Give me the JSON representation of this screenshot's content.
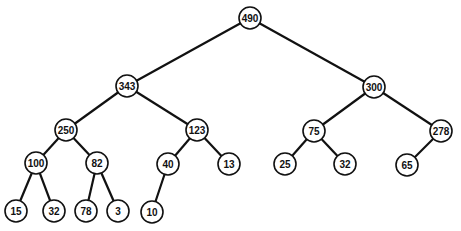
{
  "diagram": {
    "type": "binary-tree",
    "nodes": [
      {
        "id": "n490",
        "label": "490",
        "x": 250,
        "y": 18
      },
      {
        "id": "n343",
        "label": "343",
        "x": 127,
        "y": 86
      },
      {
        "id": "n300",
        "label": "300",
        "x": 374,
        "y": 87
      },
      {
        "id": "n250",
        "label": "250",
        "x": 66,
        "y": 130
      },
      {
        "id": "n123",
        "label": "123",
        "x": 197,
        "y": 130
      },
      {
        "id": "n75",
        "label": "75",
        "x": 314,
        "y": 131
      },
      {
        "id": "n278",
        "label": "278",
        "x": 441,
        "y": 131
      },
      {
        "id": "n100",
        "label": "100",
        "x": 36,
        "y": 163
      },
      {
        "id": "n82",
        "label": "82",
        "x": 97,
        "y": 163
      },
      {
        "id": "n40",
        "label": "40",
        "x": 168,
        "y": 164
      },
      {
        "id": "n13",
        "label": "13",
        "x": 229,
        "y": 164
      },
      {
        "id": "n25",
        "label": "25",
        "x": 285,
        "y": 164
      },
      {
        "id": "n32b",
        "label": "32",
        "x": 345,
        "y": 164
      },
      {
        "id": "n65",
        "label": "65",
        "x": 407,
        "y": 165
      },
      {
        "id": "n15",
        "label": "15",
        "x": 16,
        "y": 211
      },
      {
        "id": "n32a",
        "label": "32",
        "x": 54,
        "y": 211
      },
      {
        "id": "n78",
        "label": "78",
        "x": 86,
        "y": 211
      },
      {
        "id": "n3",
        "label": "3",
        "x": 118,
        "y": 211
      },
      {
        "id": "n10",
        "label": "10",
        "x": 152,
        "y": 212
      }
    ],
    "edges": [
      [
        "n490",
        "n343"
      ],
      [
        "n490",
        "n300"
      ],
      [
        "n343",
        "n250"
      ],
      [
        "n343",
        "n123"
      ],
      [
        "n300",
        "n75"
      ],
      [
        "n300",
        "n278"
      ],
      [
        "n250",
        "n100"
      ],
      [
        "n250",
        "n82"
      ],
      [
        "n123",
        "n40"
      ],
      [
        "n123",
        "n13"
      ],
      [
        "n75",
        "n25"
      ],
      [
        "n75",
        "n32b"
      ],
      [
        "n278",
        "n65"
      ],
      [
        "n100",
        "n15"
      ],
      [
        "n100",
        "n32a"
      ],
      [
        "n82",
        "n78"
      ],
      [
        "n82",
        "n3"
      ],
      [
        "n40",
        "n10"
      ]
    ],
    "node_radius": 11
  }
}
